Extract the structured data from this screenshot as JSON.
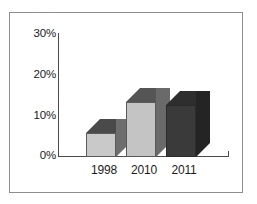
{
  "chart_data": {
    "type": "bar",
    "title": "",
    "subtitle": "",
    "xlabel": "",
    "ylabel": "",
    "categories": [
      "1998",
      "2010",
      "2011"
    ],
    "values": [
      3,
      12,
      11.5
    ],
    "value_labels": [
      "3%",
      "12%",
      "11.5%"
    ],
    "ylim": [
      0,
      30
    ],
    "ytick_labels": [
      "30%",
      "20%",
      "10%",
      "0%"
    ],
    "ytick_values": [
      30,
      20,
      10,
      0
    ],
    "grid": false,
    "legend": null,
    "style": "3d-bar-grayscale",
    "bar_colors": [
      "#c9c9c9",
      "#c4c4c4",
      "#3a3a3a"
    ],
    "bar_top_colors": [
      "#4a4a4a",
      "#555555",
      "#2e2e2e"
    ],
    "bar_side_colors": [
      "#6e6e6e",
      "#6a6a6a",
      "#242424"
    ],
    "axis_color": "#4a4a4a",
    "frame_color": "#8e8e8e",
    "background_color": "#ffffff"
  },
  "axis": {
    "y_ticks": [
      {
        "label": "30%",
        "top": 27
      },
      {
        "label": "20%",
        "top": 68
      },
      {
        "label": "10%",
        "top": 109
      },
      {
        "label": "0%",
        "top": 149
      }
    ],
    "x_ticks": [
      {
        "label": "1998",
        "left": 84
      },
      {
        "label": "2010",
        "left": 124
      },
      {
        "label": "2011",
        "left": 164
      }
    ]
  },
  "bars": [
    {
      "name": "1998",
      "left": 86,
      "front_left": 14,
      "front_width": 30,
      "front_height": 24,
      "depth": 14,
      "front_color": "#c9c9c9",
      "top_color": "#4a4a4a",
      "side_color": "#6e6e6e"
    },
    {
      "name": "2010",
      "left": 126,
      "front_left": 14,
      "front_width": 30,
      "front_height": 55,
      "depth": 14,
      "front_color": "#c4c4c4",
      "top_color": "#555555",
      "side_color": "#6a6a6a"
    },
    {
      "name": "2011",
      "left": 166,
      "front_left": 14,
      "front_width": 30,
      "front_height": 52,
      "depth": 14,
      "front_color": "#3a3a3a",
      "top_color": "#2e2e2e",
      "side_color": "#242424"
    }
  ]
}
